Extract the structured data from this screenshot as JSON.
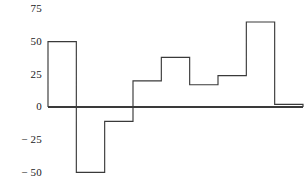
{
  "chart_data": {
    "type": "bar",
    "title": "",
    "subtitle": "",
    "xlabel": "",
    "ylabel": "",
    "categories": [
      "1",
      "2",
      "3",
      "4",
      "5",
      "6",
      "7",
      "8",
      "9"
    ],
    "values": [
      50,
      -50,
      -11,
      20,
      38,
      17,
      24,
      65,
      2
    ],
    "series": [
      {
        "name": "",
        "values": [
          50,
          -50,
          -11,
          20,
          38,
          17,
          24,
          65,
          2
        ]
      }
    ],
    "ylim": [
      -50,
      75
    ],
    "yticks": [
      75,
      50,
      25,
      0,
      -25,
      -50
    ],
    "ytick_labels": [
      "75",
      "50",
      "25",
      "0",
      "− 25",
      "− 50"
    ],
    "xticks": [],
    "xtick_labels": [],
    "grid": false,
    "legend": false,
    "legend_position": "none",
    "annotations": [],
    "style": {
      "line_color": "#3a3a3a",
      "fill_color": "none",
      "background": "#ffffff",
      "baseline_value": 0
    }
  },
  "axis": {
    "y_labels": [
      {
        "text": "75",
        "value": 75
      },
      {
        "text": "50",
        "value": 50
      },
      {
        "text": "25",
        "value": 25
      },
      {
        "text": "0",
        "value": 0
      },
      {
        "text": "− 25",
        "value": -25
      },
      {
        "text": "− 50",
        "value": -50
      }
    ]
  }
}
